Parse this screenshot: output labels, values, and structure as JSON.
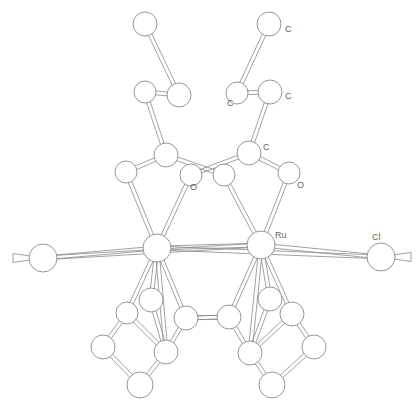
{
  "figure": {
    "kind": "ball-and-stick crystal structure",
    "background_color": "#ffffff",
    "bond_color": "#8a8a8a",
    "atom_fill_color": "#ffffff",
    "atom_stroke_color": "#8a8a8a",
    "label_color": "#5f5f5f",
    "width": 420,
    "height": 410
  },
  "labels": [
    {
      "id": "label-c-top-right",
      "text": "C",
      "x": 285,
      "y": 30
    },
    {
      "id": "label-c-upper-left",
      "text": "C",
      "x": 227,
      "y": 104
    },
    {
      "id": "label-c-upper-right",
      "text": "C",
      "x": 285,
      "y": 97
    },
    {
      "id": "label-c-mid-right",
      "text": "C",
      "x": 263,
      "y": 148
    },
    {
      "id": "label-o-left",
      "text": "O",
      "x": 190,
      "y": 188
    },
    {
      "id": "label-o-right",
      "text": "O",
      "x": 297,
      "y": 186
    },
    {
      "id": "label-ru",
      "text": "Ru",
      "x": 275,
      "y": 236
    },
    {
      "id": "label-cl",
      "text": "Cl",
      "x": 372,
      "y": 238
    }
  ],
  "atoms": [
    {
      "id": "atom-c-top-left",
      "element": "C",
      "x": 145,
      "y": 24,
      "r": 12
    },
    {
      "id": "atom-c-top-right",
      "element": "C",
      "x": 269,
      "y": 24,
      "r": 12
    },
    {
      "id": "atom-c-mid-upper-left",
      "element": "C",
      "x": 145,
      "y": 92,
      "r": 11
    },
    {
      "id": "atom-c-mid-upper-left2",
      "element": "C",
      "x": 179,
      "y": 95,
      "r": 12
    },
    {
      "id": "atom-c-mid-upper-right",
      "element": "C",
      "x": 237,
      "y": 93,
      "r": 11
    },
    {
      "id": "atom-c-mid-upper-rt2",
      "element": "C",
      "x": 270,
      "y": 92,
      "r": 12
    },
    {
      "id": "atom-c-carbonyl-left",
      "element": "C",
      "x": 166,
      "y": 155,
      "r": 12
    },
    {
      "id": "atom-c-carbonyl-right",
      "element": "C",
      "x": 249,
      "y": 153,
      "r": 12
    },
    {
      "id": "atom-c-ring-left",
      "element": "C",
      "x": 126,
      "y": 172,
      "r": 11
    },
    {
      "id": "atom-o-left",
      "element": "O",
      "x": 191,
      "y": 175,
      "r": 11
    },
    {
      "id": "atom-o-center",
      "element": "O",
      "x": 224,
      "y": 175,
      "r": 11
    },
    {
      "id": "atom-o-right",
      "element": "O",
      "x": 289,
      "y": 173,
      "r": 11
    },
    {
      "id": "atom-i",
      "element": "I",
      "x": 43,
      "y": 258,
      "r": 14
    },
    {
      "id": "atom-ru-left",
      "element": "Ru",
      "x": 157,
      "y": 248,
      "r": 14
    },
    {
      "id": "atom-ru-right",
      "element": "Ru",
      "x": 261,
      "y": 245,
      "r": 14
    },
    {
      "id": "atom-cl",
      "element": "Cl",
      "x": 381,
      "y": 257,
      "r": 14
    },
    {
      "id": "atom-c-low-left-a",
      "element": "C",
      "x": 151,
      "y": 300,
      "r": 12
    },
    {
      "id": "atom-c-low-left-b",
      "element": "C",
      "x": 127,
      "y": 313,
      "r": 11
    },
    {
      "id": "atom-c-low-left-c",
      "element": "C",
      "x": 186,
      "y": 318,
      "r": 12
    },
    {
      "id": "atom-c-low-left-d",
      "element": "C",
      "x": 103,
      "y": 347,
      "r": 12
    },
    {
      "id": "atom-c-low-left-e",
      "element": "C",
      "x": 166,
      "y": 352,
      "r": 12
    },
    {
      "id": "atom-c-low-left-f",
      "element": "C",
      "x": 140,
      "y": 385,
      "r": 13
    },
    {
      "id": "atom-c-low-right-a",
      "element": "C",
      "x": 270,
      "y": 299,
      "r": 12
    },
    {
      "id": "atom-c-low-right-b",
      "element": "C",
      "x": 229,
      "y": 317,
      "r": 12
    },
    {
      "id": "atom-c-low-right-c",
      "element": "C",
      "x": 292,
      "y": 314,
      "r": 12
    },
    {
      "id": "atom-c-low-right-d",
      "element": "C",
      "x": 250,
      "y": 353,
      "r": 12
    },
    {
      "id": "atom-c-low-right-e",
      "element": "C",
      "x": 314,
      "y": 347,
      "r": 12
    },
    {
      "id": "atom-c-low-right-f",
      "element": "C",
      "x": 272,
      "y": 385,
      "r": 13
    }
  ],
  "bonds": [
    {
      "from": "atom-c-top-left",
      "to": "atom-c-mid-upper-left2"
    },
    {
      "from": "atom-c-top-right",
      "to": "atom-c-mid-upper-right"
    },
    {
      "from": "atom-c-mid-upper-left",
      "to": "atom-c-mid-upper-left2"
    },
    {
      "from": "atom-c-mid-upper-right",
      "to": "atom-c-mid-upper-rt2"
    },
    {
      "from": "atom-c-mid-upper-left",
      "to": "atom-c-carbonyl-left"
    },
    {
      "from": "atom-c-mid-upper-rt2",
      "to": "atom-c-carbonyl-right"
    },
    {
      "from": "atom-c-carbonyl-left",
      "to": "atom-c-ring-left"
    },
    {
      "from": "atom-c-carbonyl-left",
      "to": "atom-o-center"
    },
    {
      "from": "atom-c-carbonyl-right",
      "to": "atom-o-left"
    },
    {
      "from": "atom-c-carbonyl-right",
      "to": "atom-o-right"
    },
    {
      "from": "atom-c-ring-left",
      "to": "atom-ru-left"
    },
    {
      "from": "atom-o-left",
      "to": "atom-ru-left"
    },
    {
      "from": "atom-o-center",
      "to": "atom-ru-right"
    },
    {
      "from": "atom-o-right",
      "to": "atom-ru-right"
    },
    {
      "from": "atom-i",
      "to": "atom-ru-left"
    },
    {
      "from": "atom-i",
      "to": "atom-ru-right"
    },
    {
      "from": "atom-ru-left",
      "to": "atom-ru-right"
    },
    {
      "from": "atom-ru-right",
      "to": "atom-cl"
    },
    {
      "from": "atom-ru-left",
      "to": "atom-cl"
    },
    {
      "from": "atom-ru-left",
      "to": "atom-c-low-left-a"
    },
    {
      "from": "atom-ru-left",
      "to": "atom-c-low-left-b"
    },
    {
      "from": "atom-ru-left",
      "to": "atom-c-low-left-c"
    },
    {
      "from": "atom-ru-left",
      "to": "atom-c-low-left-e"
    },
    {
      "from": "atom-ru-right",
      "to": "atom-c-low-right-a"
    },
    {
      "from": "atom-ru-right",
      "to": "atom-c-low-right-b"
    },
    {
      "from": "atom-ru-right",
      "to": "atom-c-low-right-c"
    },
    {
      "from": "atom-ru-right",
      "to": "atom-c-low-right-d"
    },
    {
      "from": "atom-c-low-left-a",
      "to": "atom-c-low-left-e"
    },
    {
      "from": "atom-c-low-left-b",
      "to": "atom-c-low-left-d"
    },
    {
      "from": "atom-c-low-left-b",
      "to": "atom-c-low-left-e"
    },
    {
      "from": "atom-c-low-left-c",
      "to": "atom-c-low-left-e"
    },
    {
      "from": "atom-c-low-left-d",
      "to": "atom-c-low-left-f"
    },
    {
      "from": "atom-c-low-left-e",
      "to": "atom-c-low-left-f"
    },
    {
      "from": "atom-c-low-left-c",
      "to": "atom-c-low-right-b"
    },
    {
      "from": "atom-c-low-right-a",
      "to": "atom-c-low-right-d"
    },
    {
      "from": "atom-c-low-right-b",
      "to": "atom-c-low-right-d"
    },
    {
      "from": "atom-c-low-right-c",
      "to": "atom-c-low-right-d"
    },
    {
      "from": "atom-c-low-right-c",
      "to": "atom-c-low-right-e"
    },
    {
      "from": "atom-c-low-right-d",
      "to": "atom-c-low-right-f"
    },
    {
      "from": "atom-c-low-right-e",
      "to": "atom-c-low-right-f"
    },
    {
      "from": "atom-c-low-right-b",
      "to": "atom-c-low-left-c"
    }
  ]
}
